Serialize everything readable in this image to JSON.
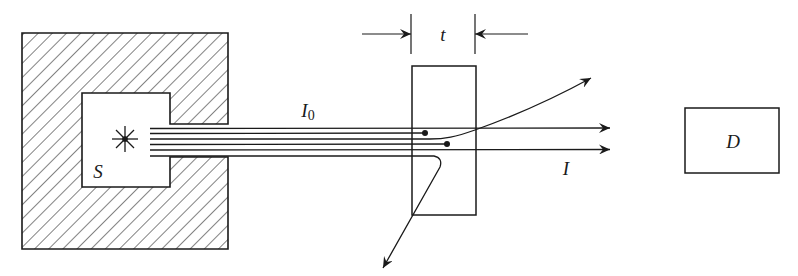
{
  "diagram": {
    "colors": {
      "ink": "#1a1a1a",
      "background": "#ffffff"
    },
    "labels": {
      "source": "S",
      "incident_beam_main": "I",
      "incident_beam_sub": "0",
      "thickness": "t",
      "transmitted_beam": "I",
      "detector": "D"
    },
    "elements": {
      "shield": {
        "outer": [
          22,
          33,
          228,
          249
        ],
        "cavity": [
          82,
          93,
          170,
          187
        ],
        "slot_y": [
          124,
          157
        ],
        "hatched": true
      },
      "source_star": {
        "cx": 125,
        "cy": 139,
        "r": 13
      },
      "beam_lines_y": [
        129,
        134,
        140,
        145,
        150,
        156
      ],
      "slab": {
        "x": [
          412,
          476
        ],
        "y": [
          66,
          215
        ]
      },
      "thickness_dimension": {
        "ticks_x": [
          411,
          475
        ],
        "arrow_y": 34
      },
      "detector_box": {
        "x": [
          685,
          779
        ],
        "y": [
          108,
          173
        ]
      },
      "rays": [
        {
          "type": "transmitted",
          "y": 128,
          "end_x": 610
        },
        {
          "type": "absorbed",
          "y": 133,
          "end_x": 425
        },
        {
          "type": "forward-scattered",
          "end": [
            591,
            78
          ]
        },
        {
          "type": "absorbed",
          "y": 144,
          "end_x": 447
        },
        {
          "type": "transmitted",
          "y": 149,
          "end_x": 610
        },
        {
          "type": "back-scattered",
          "end": [
            383,
            268
          ]
        }
      ]
    }
  }
}
